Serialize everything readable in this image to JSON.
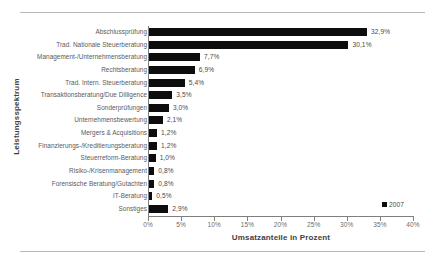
{
  "chart_data": {
    "type": "bar",
    "orientation": "horizontal",
    "title": "",
    "xlabel": "Umsatzanteile in Prozent",
    "ylabel": "Leistungsspektrum",
    "xlim": [
      0,
      40
    ],
    "grid": false,
    "legend_position": "bottom-right",
    "xticks": [
      "0%",
      "5%",
      "10%",
      "15%",
      "20%",
      "25%",
      "30%",
      "35%",
      "40%"
    ],
    "xtick_values": [
      0,
      5,
      10,
      15,
      20,
      25,
      30,
      35,
      40
    ],
    "series": [
      {
        "name": "2007",
        "color": "#0d0d0d",
        "values": [
          32.9,
          30.1,
          7.7,
          6.9,
          5.4,
          3.5,
          3.0,
          2.1,
          1.2,
          1.2,
          1.0,
          0.8,
          0.8,
          0.5,
          2.9
        ]
      }
    ],
    "categories": [
      "Abschlussprüfung",
      "Trad. Nationale Steuerberatung",
      "Management-/Unternehmensberatung",
      "Rechtsberatung",
      "Trad. Intern. Steuerberatung",
      "Transaktionsberatung/Due Dilligence",
      "Sonderprüfungen",
      "Unternehmensbewertung",
      "Mergers & Acquisitions",
      "Finanzierungs-/Kreditierungsberatung",
      "Steuerreform-Beratung",
      "Risiko-/Krisenmanagement",
      "Forensische Beratung/Gutachten",
      "IT-Beratung",
      "Sonstiges"
    ],
    "data_labels": [
      "32,9%",
      "30,1%",
      "7,7%",
      "6,9%",
      "5,4%",
      "3,5%",
      "3,0%",
      "2,1%",
      "1,2%",
      "1,2%",
      "1,0%",
      "0,8%",
      "0,8%",
      "0,5%",
      "2,9%"
    ]
  },
  "legend": {
    "entries": [
      {
        "label": "2007",
        "color": "#0d0d0d"
      }
    ]
  }
}
